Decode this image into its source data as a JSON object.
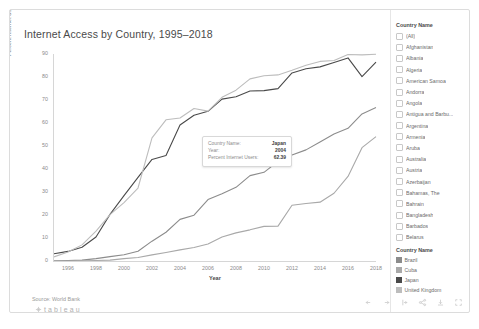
{
  "title": "Internet Access by Country, 1995–2018",
  "caption": "Source: World Bank",
  "brand": "tableau",
  "axes": {
    "ylabel": "Percent Internet Users",
    "xlabel": "Year",
    "yticks": [
      "90",
      "80",
      "70",
      "60",
      "50",
      "40",
      "30",
      "20",
      "10",
      "0"
    ],
    "xticks": [
      "1996",
      "1998",
      "2000",
      "2002",
      "2004",
      "2006",
      "2008",
      "2010",
      "2012",
      "2014",
      "2016",
      "2018"
    ]
  },
  "tooltip": {
    "rows": [
      {
        "key": "Country Name:",
        "value": "Japan"
      },
      {
        "key": "Year:",
        "value": "2004"
      },
      {
        "key": "Percent Internet Users:",
        "value": "62.39"
      }
    ]
  },
  "filter": {
    "heading": "Country Name",
    "items": [
      "(All)",
      "Afghanistan",
      "Albania",
      "Algeria",
      "American Samoa",
      "Andorra",
      "Angola",
      "Antigua and Barbu...",
      "Argentina",
      "Armenia",
      "Aruba",
      "Australia",
      "Austria",
      "Azerbaijan",
      "Bahamas, The",
      "Bahrain",
      "Bangladesh",
      "Barbados",
      "Belarus",
      "Belgium",
      "Belize",
      "Benin",
      "Bermuda",
      "Bhutan",
      "Bolivia"
    ]
  },
  "color_legend": {
    "heading": "Country Name",
    "items": [
      {
        "label": "Brazil",
        "color": "#8c8c8c"
      },
      {
        "label": "Cuba",
        "color": "#a9a9a9"
      },
      {
        "label": "Japan",
        "color": "#4a4a4a"
      },
      {
        "label": "United Kingdom",
        "color": "#bdbdbd"
      }
    ]
  },
  "toolbar": {
    "buttons": [
      "undo-icon",
      "redo-icon",
      "revert-icon",
      "share-icon",
      "download-icon",
      "fullscreen-icon"
    ]
  },
  "chart_data": {
    "type": "line",
    "title": "Internet Access by Country, 1995–2018",
    "xlabel": "Year",
    "ylabel": "Percent Internet Users",
    "xlim": [
      1995,
      2018
    ],
    "ylim": [
      0,
      95
    ],
    "grid": false,
    "legend_position": "right",
    "x": [
      1995,
      1996,
      1997,
      1998,
      1999,
      2000,
      2001,
      2002,
      2003,
      2004,
      2005,
      2006,
      2007,
      2008,
      2009,
      2010,
      2011,
      2012,
      2013,
      2014,
      2015,
      2016,
      2017,
      2018
    ],
    "series": [
      {
        "name": "Japan",
        "color": "#4a4a4a",
        "values": [
          3.3,
          4.4,
          6.3,
          11.0,
          21.4,
          30.0,
          38.4,
          46.6,
          48.4,
          62.4,
          66.9,
          68.7,
          74.3,
          75.4,
          78.0,
          78.2,
          79.1,
          86.3,
          88.2,
          89.1,
          91.1,
          93.2,
          84.6,
          91.3
        ]
      },
      {
        "name": "United Kingdom",
        "color": "#bdbdbd",
        "values": [
          1.9,
          4.1,
          7.4,
          13.7,
          21.3,
          26.8,
          33.5,
          56.5,
          64.8,
          65.6,
          70.0,
          68.8,
          75.1,
          78.4,
          83.6,
          85.0,
          85.4,
          87.5,
          89.8,
          91.6,
          92.0,
          94.8,
          94.6,
          94.9
        ]
      },
      {
        "name": "Brazil",
        "color": "#8c8c8c",
        "values": [
          0.1,
          0.2,
          0.4,
          1.1,
          2.0,
          2.9,
          4.5,
          9.1,
          13.2,
          19.1,
          21.0,
          28.2,
          30.9,
          33.8,
          39.2,
          40.7,
          45.7,
          48.6,
          51.0,
          54.6,
          58.3,
          60.9,
          67.5,
          70.4
        ]
      },
      {
        "name": "Cuba",
        "color": "#a9a9a9",
        "values": [
          0.0,
          0.0,
          0.1,
          0.2,
          0.4,
          1.1,
          1.6,
          2.8,
          3.9,
          5.1,
          6.2,
          7.8,
          11.0,
          12.9,
          14.3,
          15.9,
          16.0,
          25.6,
          26.4,
          27.0,
          31.1,
          38.8,
          52.0,
          57.1
        ]
      }
    ]
  }
}
